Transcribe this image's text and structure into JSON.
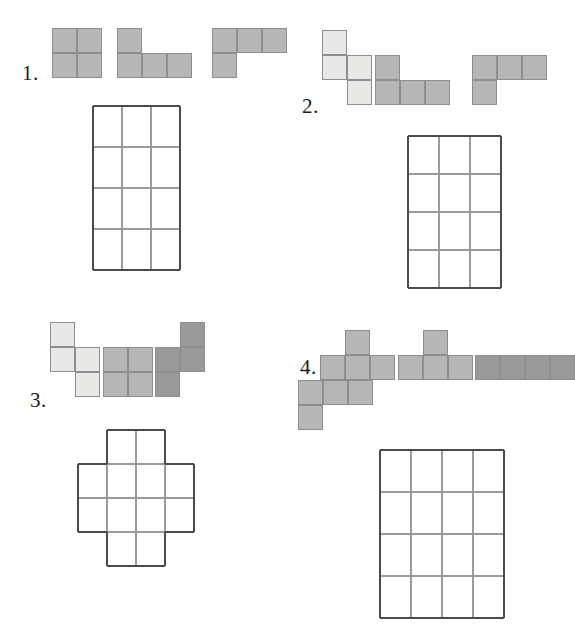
{
  "worksheet": {
    "title": "Tetromino tiling puzzles worksheet",
    "background_color": "#ffffff",
    "width": 571,
    "height": 640,
    "shape_fill_light": "#e8e8e6",
    "shape_fill_medium": "#b6b6b6",
    "shape_fill_dark": "#9a9a9a",
    "shape_stroke": "#8e8e8e",
    "grid_line_color": "#9a9a9a",
    "grid_border_color": "#4a4a4a",
    "cell_size": 25
  },
  "puzzles": [
    {
      "number": "1.",
      "label_x": 22,
      "label_y": 63,
      "tray": {
        "x": 52,
        "y": 28
      },
      "pieces": [
        {
          "name": "square-tetromino",
          "fill": "#b6b6b6",
          "origin_col": 0,
          "origin_row": 0,
          "cells": [
            [
              0,
              0
            ],
            [
              1,
              0
            ],
            [
              0,
              1
            ],
            [
              1,
              1
            ]
          ]
        },
        {
          "name": "j-tetromino",
          "fill": "#b6b6b6",
          "origin_col": 2.6,
          "origin_row": 0,
          "cells": [
            [
              0,
              0
            ],
            [
              0,
              1
            ],
            [
              1,
              1
            ],
            [
              2,
              1
            ]
          ]
        },
        {
          "name": "l-tetromino",
          "fill": "#b6b6b6",
          "origin_col": 6.4,
          "origin_row": 0,
          "cells": [
            [
              0,
              0
            ],
            [
              1,
              0
            ],
            [
              2,
              0
            ],
            [
              0,
              1
            ]
          ]
        }
      ],
      "board": {
        "name": "grid-3x4",
        "x": 93,
        "y": 106,
        "cols": 4,
        "rows": 4,
        "cell_w": 29,
        "cell_h": 41,
        "filled": [
          [
            0,
            0
          ],
          [
            1,
            0
          ],
          [
            2,
            0
          ],
          [
            0,
            1
          ],
          [
            1,
            1
          ],
          [
            2,
            1
          ],
          [
            0,
            2
          ],
          [
            1,
            2
          ],
          [
            2,
            2
          ],
          [
            0,
            3
          ],
          [
            1,
            3
          ],
          [
            2,
            3
          ]
        ]
      }
    },
    {
      "number": "2.",
      "label_x": 302,
      "label_y": 96,
      "tray": {
        "x": 322,
        "y": 30
      },
      "pieces": [
        {
          "name": "s-tetromino",
          "fill": "#e8e8e6",
          "origin_col": 0,
          "origin_row": 0,
          "cells": [
            [
              0,
              0
            ],
            [
              0,
              1
            ],
            [
              1,
              1
            ],
            [
              1,
              2
            ]
          ]
        },
        {
          "name": "j-tetromino",
          "fill": "#b6b6b6",
          "origin_col": 2.1,
          "origin_row": 1,
          "cells": [
            [
              0,
              0
            ],
            [
              0,
              1
            ],
            [
              1,
              1
            ],
            [
              2,
              1
            ]
          ]
        },
        {
          "name": "l-tetromino",
          "fill": "#b6b6b6",
          "origin_col": 6.0,
          "origin_row": 1,
          "cells": [
            [
              0,
              0
            ],
            [
              1,
              0
            ],
            [
              2,
              0
            ],
            [
              0,
              1
            ]
          ]
        }
      ],
      "board": {
        "name": "grid-3x4",
        "x": 408,
        "y": 136,
        "cols": 4,
        "rows": 4,
        "cell_w": 31,
        "cell_h": 38,
        "filled": [
          [
            0,
            0
          ],
          [
            1,
            0
          ],
          [
            2,
            0
          ],
          [
            0,
            1
          ],
          [
            1,
            1
          ],
          [
            2,
            1
          ],
          [
            0,
            2
          ],
          [
            1,
            2
          ],
          [
            2,
            2
          ],
          [
            0,
            3
          ],
          [
            1,
            3
          ],
          [
            2,
            3
          ]
        ]
      }
    },
    {
      "number": "3.",
      "label_x": 30,
      "label_y": 390,
      "tray": {
        "x": 50,
        "y": 322
      },
      "pieces": [
        {
          "name": "s-tetromino",
          "fill": "#e8e8e6",
          "origin_col": 0,
          "origin_row": 0,
          "cells": [
            [
              0,
              0
            ],
            [
              0,
              1
            ],
            [
              1,
              1
            ],
            [
              1,
              2
            ]
          ]
        },
        {
          "name": "square-tetromino",
          "fill": "#b6b6b6",
          "origin_col": 2.1,
          "origin_row": 1,
          "cells": [
            [
              0,
              0
            ],
            [
              1,
              0
            ],
            [
              0,
              1
            ],
            [
              1,
              1
            ]
          ]
        },
        {
          "name": "z-tetromino",
          "fill": "#9a9a9a",
          "origin_col": 4.2,
          "origin_row": 0,
          "cells": [
            [
              1,
              0
            ],
            [
              0,
              1
            ],
            [
              1,
              1
            ],
            [
              0,
              2
            ]
          ]
        }
      ],
      "board": {
        "name": "grid-cross",
        "x": 78,
        "y": 430,
        "cols": 4,
        "rows": 4,
        "cell_w": 29,
        "cell_h": 34,
        "filled": [
          [
            1,
            0
          ],
          [
            2,
            0
          ],
          [
            0,
            1
          ],
          [
            1,
            1
          ],
          [
            2,
            1
          ],
          [
            3,
            1
          ],
          [
            0,
            2
          ],
          [
            1,
            2
          ],
          [
            2,
            2
          ],
          [
            3,
            2
          ],
          [
            1,
            3
          ],
          [
            2,
            3
          ]
        ]
      }
    },
    {
      "number": "4.",
      "label_x": 300,
      "label_y": 357,
      "tray": {
        "x": 320,
        "y": 330
      },
      "pieces": [
        {
          "name": "t-tetromino",
          "fill": "#b6b6b6",
          "origin_col": 0,
          "origin_row": 0,
          "cells": [
            [
              1,
              0
            ],
            [
              0,
              1
            ],
            [
              1,
              1
            ],
            [
              2,
              1
            ]
          ]
        },
        {
          "name": "t-tetromino",
          "fill": "#b6b6b6",
          "origin_col": 3.1,
          "origin_row": 0,
          "cells": [
            [
              1,
              0
            ],
            [
              0,
              1
            ],
            [
              1,
              1
            ],
            [
              2,
              1
            ]
          ]
        },
        {
          "name": "i-tetromino",
          "fill": "#9a9a9a",
          "origin_col": 6.2,
          "origin_row": 1,
          "cells": [
            [
              0,
              0
            ],
            [
              1,
              0
            ],
            [
              2,
              0
            ],
            [
              3,
              0
            ]
          ]
        },
        {
          "name": "j-tetromino",
          "fill": "#b6b6b6",
          "origin_col": -0.9,
          "origin_row": 2,
          "cells": [
            [
              0,
              0
            ],
            [
              1,
              0
            ],
            [
              2,
              0
            ],
            [
              0,
              1
            ]
          ]
        }
      ],
      "board": {
        "name": "grid-4x4",
        "x": 380,
        "y": 450,
        "cols": 4,
        "rows": 4,
        "cell_w": 31,
        "cell_h": 42,
        "filled": [
          [
            0,
            0
          ],
          [
            1,
            0
          ],
          [
            2,
            0
          ],
          [
            3,
            0
          ],
          [
            0,
            1
          ],
          [
            1,
            1
          ],
          [
            2,
            1
          ],
          [
            3,
            1
          ],
          [
            0,
            2
          ],
          [
            1,
            2
          ],
          [
            2,
            2
          ],
          [
            3,
            2
          ],
          [
            0,
            3
          ],
          [
            1,
            3
          ],
          [
            2,
            3
          ],
          [
            3,
            3
          ]
        ]
      }
    }
  ]
}
